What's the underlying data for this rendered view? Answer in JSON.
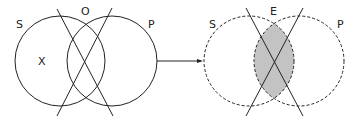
{
  "diagram": {
    "type": "venn-transformation",
    "left": {
      "labels": {
        "s": "S",
        "o": "O",
        "p": "P",
        "x": "X"
      },
      "circles": [
        {
          "name": "S",
          "cx": 60,
          "cy": 61,
          "r": 45,
          "style": "solid"
        },
        {
          "name": "P",
          "cx": 112,
          "cy": 61,
          "r": 45,
          "style": "solid"
        }
      ],
      "lines": [
        {
          "x1": 57,
          "y1": 9,
          "x2": 113,
          "y2": 116
        },
        {
          "x1": 112,
          "y1": 8,
          "x2": 57,
          "y2": 116
        }
      ],
      "marker": "X"
    },
    "arrow": {
      "x1": 157,
      "y1": 61,
      "x2": 203,
      "y2": 61
    },
    "right": {
      "labels": {
        "s": "S",
        "e": "E",
        "p": "P"
      },
      "circles": [
        {
          "name": "S",
          "cx": 249,
          "cy": 61,
          "r": 45,
          "style": "dashed"
        },
        {
          "name": "P",
          "cx": 299,
          "cy": 61,
          "r": 45,
          "style": "dashed"
        }
      ],
      "lines": [
        {
          "x1": 246,
          "y1": 8,
          "x2": 303,
          "y2": 116
        },
        {
          "x1": 303,
          "y1": 8,
          "x2": 246,
          "y2": 116
        }
      ],
      "shaded_region": "S∩P",
      "shade_color": "#c8c8c8"
    },
    "stroke_color": "#222222"
  }
}
